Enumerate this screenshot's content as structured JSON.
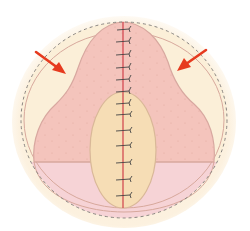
{
  "figure": {
    "type": "surgical-illustration",
    "colors": {
      "background": "#ffffff",
      "outer_region": "#fbefd8",
      "outer_glow": "#fdf3e2",
      "dashed_outline": "#888480",
      "flap_fill": "#f4c4bc",
      "flap_stroke": "#d8a8a0",
      "lower_band": "#f6d3d6",
      "inner_oval": "#f6ddb5",
      "inner_oval_stroke": "#d9b898",
      "suture_line": "#d0404a",
      "suture_stitch": "#444444",
      "arrow": "#e63a1e"
    },
    "arrows": [
      {
        "id": "left-arrow",
        "direction": "down-right"
      },
      {
        "id": "right-arrow",
        "direction": "down-left"
      }
    ],
    "sutures": {
      "upper_count": 8,
      "lower_count": 6
    }
  }
}
